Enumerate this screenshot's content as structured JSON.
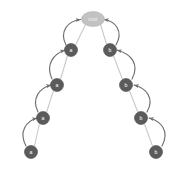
{
  "diagram": {
    "type": "tree",
    "title": "",
    "background_color": "#ffffff",
    "node_fill_color": "#5b5b5b",
    "root_fill_color": "#c2c2c2",
    "node_label_color": "#ffffff",
    "tree_edge_color": "#c9c9c9",
    "suffix_link_color": "#6e6e6e",
    "nodes": [
      {
        "id": "root",
        "label": "root",
        "x": 93,
        "y": 19,
        "rx": 11.5,
        "ry": 7.5,
        "shape": "ellipse",
        "style": "root"
      },
      {
        "id": "a1",
        "label": "a",
        "x": 71,
        "y": 50,
        "rx": 6.5,
        "ry": 6.5,
        "shape": "circle",
        "style": "node"
      },
      {
        "id": "a2",
        "label": "a",
        "x": 57,
        "y": 85,
        "rx": 6.5,
        "ry": 6.5,
        "shape": "circle",
        "style": "node"
      },
      {
        "id": "a3",
        "label": "a",
        "x": 43,
        "y": 118,
        "rx": 6.5,
        "ry": 6.5,
        "shape": "circle",
        "style": "node"
      },
      {
        "id": "a4",
        "label": "a",
        "x": 31,
        "y": 152,
        "rx": 6.5,
        "ry": 6.5,
        "shape": "circle",
        "style": "node"
      },
      {
        "id": "b1",
        "label": "b",
        "x": 110,
        "y": 50,
        "rx": 6.5,
        "ry": 6.5,
        "shape": "circle",
        "style": "node"
      },
      {
        "id": "b2",
        "label": "b",
        "x": 126,
        "y": 85,
        "rx": 6.5,
        "ry": 6.5,
        "shape": "circle",
        "style": "node"
      },
      {
        "id": "b3",
        "label": "b",
        "x": 141,
        "y": 118,
        "rx": 6.5,
        "ry": 6.5,
        "shape": "circle",
        "style": "node"
      },
      {
        "id": "b4",
        "label": "b",
        "x": 156,
        "y": 152,
        "rx": 6.5,
        "ry": 6.5,
        "shape": "circle",
        "style": "node"
      }
    ],
    "tree_edges": [
      {
        "from": "root",
        "to": "a1",
        "path": "M 85.5,24.5 L 75.5,45"
      },
      {
        "from": "a1",
        "to": "a2",
        "path": "M 67.5,55.5 L 60.5,79.5"
      },
      {
        "from": "a2",
        "to": "a3",
        "path": "M 53.5,90.5 L 46.5,112.5"
      },
      {
        "from": "a3",
        "to": "a4",
        "path": "M 39.5,123.5 L 34.5,146"
      },
      {
        "from": "root",
        "to": "b1",
        "path": "M 100.5,24.5 L 106.5,44"
      },
      {
        "from": "b1",
        "to": "b2",
        "path": "M 113.5,56 L 122.5,79.5"
      },
      {
        "from": "b2",
        "to": "b3",
        "path": "M 129.5,91 L 138,112.5"
      },
      {
        "from": "b3",
        "to": "b4",
        "path": "M 144.5,124 L 152.5,146"
      }
    ],
    "suffix_links": [
      {
        "from": "a1",
        "to": "root",
        "path": "M 66,45 C 59,31 68,21 80.5,19.5"
      },
      {
        "from": "a2",
        "to": "a1",
        "path": "M 52,79 C 45,64 54,54 65,50"
      },
      {
        "from": "a3",
        "to": "a2",
        "path": "M 38,112 C 31,98 40,88 51,85"
      },
      {
        "from": "a4",
        "to": "a3",
        "path": "M 26,146 C 18,131 27,121 37,118"
      },
      {
        "from": "b1",
        "to": "root",
        "path": "M 116,45 C 124,31 115,21 104,19.5"
      },
      {
        "from": "b2",
        "to": "b1",
        "path": "M 132,79 C 140,64 131,54 117,50"
      },
      {
        "from": "b3",
        "to": "b2",
        "path": "M 147,112 C 155,98 146,88 134,85"
      },
      {
        "from": "b4",
        "to": "b3",
        "path": "M 162,146 C 170,131 161,121 149,118"
      }
    ]
  }
}
